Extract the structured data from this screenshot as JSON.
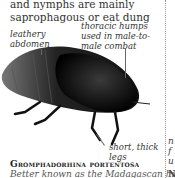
{
  "intro_text": "and nymphs are mainly saprophagous or eat dung",
  "labels": {
    "leathery": "leathery abdomen",
    "thoracic": "thoracic humps used in male-to-male combat",
    "legs": "short, thick legs"
  },
  "species": {
    "name": "Gromphadorhina portentosa",
    "description": "Better known as the Madagascan hissing"
  },
  "right_column_fragments": [
    "n",
    "f",
    "u",
    "N"
  ],
  "image": {
    "subject": "madagascan-hissing-cockroach-photo"
  }
}
